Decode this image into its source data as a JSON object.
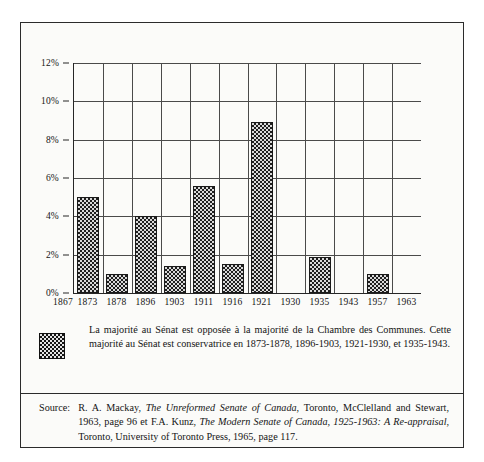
{
  "chart_data": {
    "type": "bar",
    "title": "",
    "subtitle": "",
    "xlabel": "",
    "ylabel": "",
    "categories": [
      "1867",
      "1873",
      "1878",
      "1896",
      "1903",
      "1911",
      "1916",
      "1921",
      "1930",
      "1935",
      "1943",
      "1957",
      "1963"
    ],
    "values": [
      0,
      5.0,
      1.0,
      4.0,
      1.4,
      5.6,
      1.5,
      8.9,
      0,
      1.9,
      0,
      1.0,
      0
    ],
    "ylim": [
      0,
      12
    ],
    "ytick_values": [
      0,
      2,
      4,
      6,
      8,
      10,
      12
    ],
    "ytick_labels": [
      "0%",
      "2%",
      "4%",
      "6%",
      "8%",
      "10%",
      "12%"
    ],
    "xtick_labels": [
      "1867",
      "1873",
      "1878",
      "1896",
      "1903",
      "1911",
      "1916",
      "1921",
      "1930",
      "1935",
      "1943",
      "1957",
      "1963"
    ],
    "grid": true,
    "legend_position": "below-plot",
    "bar_fill": "checkerboard-hatch",
    "bar_edge_color": "#1a1a1a",
    "grid_color": "#4a4a4a",
    "background_color": "#fbfbf9"
  },
  "legend": {
    "swatch_name": "checkerboard-swatch",
    "text": "La majorité au Sénat est opposée à la majorité de la Chambre des Communes. Cette majorité au Sénat est conservatrice en 1873-1878, 1896-1903, 1921-1930, et 1935-1943."
  },
  "source": {
    "label": "Source:",
    "part1": "R. A. Mackay, ",
    "title1": "The Unreformed Senate of Canada",
    "part2": ", Toronto, McClelland and Stewart, 1963, page 96 et F.A. Kunz, ",
    "title2": "The Modern Senate of Canada, 1925-1963: A Re-appraisal",
    "part3": ", Toronto, University of Toronto Press, 1965, page 117."
  }
}
